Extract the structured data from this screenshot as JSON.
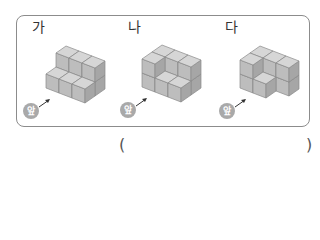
{
  "figures": [
    {
      "label": "가",
      "front_badge": "앞",
      "heights": [
        [
          1,
          1,
          1
        ],
        [
          2,
          2,
          2
        ]
      ]
    },
    {
      "label": "나",
      "front_badge": "앞",
      "heights": [
        [
          2,
          1,
          1
        ],
        [
          2,
          2,
          2
        ]
      ]
    },
    {
      "label": "다",
      "front_badge": "앞",
      "heights": [
        [
          2,
          1,
          0
        ],
        [
          2,
          2,
          2
        ]
      ]
    }
  ],
  "answer": {
    "open_paren": "(",
    "close_paren": ")",
    "value": ""
  },
  "colors": {
    "cube_top": "#d6d6d6",
    "cube_left": "#bdbdbd",
    "cube_right": "#a6a6a6",
    "edge": "#8a8a8a",
    "badge": "#a9a9a9",
    "border": "#8c8c8c"
  }
}
